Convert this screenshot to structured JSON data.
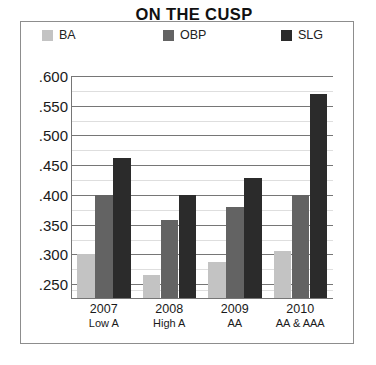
{
  "chart_data": {
    "type": "bar",
    "title": "ON THE CUSP",
    "xlabel": "",
    "ylabel": "",
    "categories": [
      "2007",
      "2008",
      "2009",
      "2010"
    ],
    "category_sublabels": [
      "Low A",
      "High A",
      "AA",
      "AA & AAA"
    ],
    "series": [
      {
        "name": "BA",
        "color": "#c3c3c3",
        "values": [
          0.3,
          0.265,
          0.288,
          0.305
        ]
      },
      {
        "name": "OBP",
        "color": "#636363",
        "values": [
          0.4,
          0.358,
          0.38,
          0.4
        ]
      },
      {
        "name": "SLG",
        "color": "#2b2b2b",
        "values": [
          0.462,
          0.4,
          0.428,
          0.57
        ]
      }
    ],
    "ylim": [
      0.225,
      0.6
    ],
    "ytick_values": [
      0.6,
      0.55,
      0.5,
      0.45,
      0.4,
      0.35,
      0.3,
      0.25
    ],
    "ytick_labels": [
      ".600",
      ".550",
      ".500",
      ".450",
      ".400",
      ".350",
      ".300",
      ".250"
    ],
    "minor_tick_values": [
      0.575,
      0.525,
      0.475,
      0.425,
      0.375,
      0.325,
      0.275,
      0.25,
      0.24
    ],
    "grid": true,
    "grid_axis": "y",
    "legend_position": "top",
    "border_color": "#8d8d8d",
    "gridline_color": "#767676",
    "minor_gridline_color": "#dedede",
    "background": "#ffffff"
  },
  "legend": {
    "items": [
      {
        "label": "BA"
      },
      {
        "label": "OBP"
      },
      {
        "label": "SLG"
      }
    ]
  }
}
